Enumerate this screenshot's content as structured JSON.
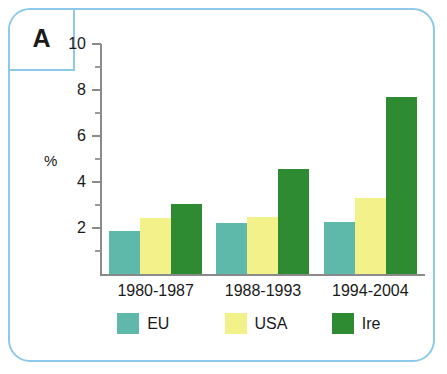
{
  "panel": {
    "letter": "A",
    "border_color": "#8cc9ea"
  },
  "chart_data": {
    "type": "bar",
    "title": "",
    "subtitle": "",
    "xlabel": "",
    "ylabel": "%",
    "ylim": [
      0,
      10
    ],
    "yticks": [
      0,
      2,
      4,
      6,
      8,
      10
    ],
    "ytick_labels": [
      "",
      "2",
      "4",
      "6",
      "8",
      "10"
    ],
    "minor_ticks": [
      1,
      3,
      5,
      7,
      9
    ],
    "grid": false,
    "legend_position": "bottom",
    "categories": [
      "1980-1987",
      "1988-1993",
      "1994-2004"
    ],
    "series": [
      {
        "name": "EU",
        "color": "#5fb9aa",
        "values": [
          1.85,
          2.2,
          2.25
        ]
      },
      {
        "name": "USA",
        "color": "#f2f18a",
        "values": [
          2.45,
          2.5,
          3.3
        ]
      },
      {
        "name": "Ire",
        "color": "#2e8b31",
        "values": [
          3.05,
          4.55,
          7.7
        ]
      }
    ]
  }
}
